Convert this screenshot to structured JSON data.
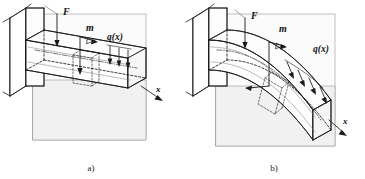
{
  "figure": {
    "type": "engineering-diagram",
    "background_color": "#ffffff",
    "line_color": "#1a1a1a",
    "plane_fill": "#f2f2f2"
  },
  "panels": [
    {
      "id": "a",
      "caption": "a)",
      "state": "undeformed",
      "labels": {
        "force": "F",
        "moment": "m",
        "distributed_load": "q(x)",
        "axis": "x"
      },
      "elements": {
        "wall": "support-wall",
        "beam": "straight-beam",
        "slice": "differential-element",
        "load_arrow_count": 3
      }
    },
    {
      "id": "b",
      "caption": "b)",
      "state": "deformed",
      "labels": {
        "force": "F",
        "moment": "m",
        "distributed_load": "q(x)",
        "axis": "x"
      },
      "elements": {
        "wall": "support-wall",
        "beam": "bent-beam",
        "slice": "differential-element",
        "load_arrow_count": 4
      }
    }
  ]
}
